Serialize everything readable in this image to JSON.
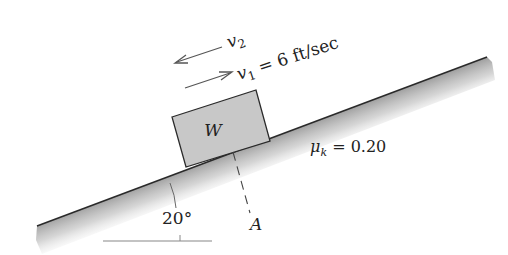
{
  "diagram": {
    "type": "inclined-plane-friction",
    "incline": {
      "angle_label": "20°",
      "surface_color": "#2a2a2a"
    },
    "block": {
      "label": "W",
      "fill_color": "#c8c8c8"
    },
    "velocities": [
      {
        "symbol": "v",
        "subscript": "2",
        "direction": "down-slope",
        "text": ""
      },
      {
        "symbol": "v",
        "subscript": "1",
        "direction": "up-slope",
        "text": " = 6 ft/sec"
      }
    ],
    "friction": {
      "symbol": "μ",
      "subscript": "k",
      "text": " = 0.20"
    },
    "reference_point": {
      "label": "A"
    }
  }
}
